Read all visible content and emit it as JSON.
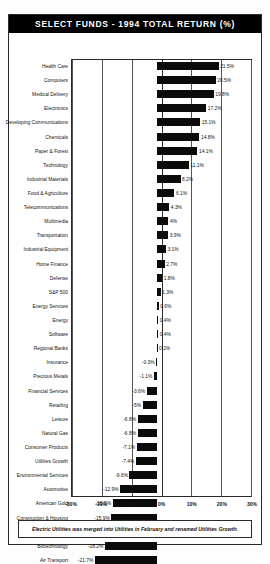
{
  "title": "SELECT FUNDS - 1994 TOTAL RETURN (%)",
  "footnote": "Electric Utilities was merged into Utilities in February and renamed Utilities Growth.",
  "chart_data": {
    "type": "bar",
    "orientation": "horizontal",
    "title": "SELECT FUNDS - 1994 TOTAL RETURN (%)",
    "xlabel": "",
    "ylabel": "",
    "xlim": [
      -30,
      30
    ],
    "grid": true,
    "legend": false,
    "ticks": [
      "-30%",
      "-20%",
      "-10%",
      "0%",
      "10%",
      "20%",
      "30%"
    ],
    "tickvalues": [
      -30,
      -20,
      -10,
      0,
      10,
      20,
      30
    ],
    "categories": [
      "Health Care",
      "Computers",
      "Medical Delivery",
      "Electronics",
      "Developing Communications",
      "Chemicals",
      "Paper & Forest",
      "Technology",
      "Industrial Materials",
      "Food & Agriculture",
      "Telecommunications",
      "Multimedia",
      "Transportation",
      "Industrial Equipment",
      "Home Finance",
      "Defense",
      "S&P 500",
      "Energy Services",
      "Energy",
      "Software",
      "Regional Banks",
      "Insurance",
      "Precious Metals",
      "Financial Services",
      "Retailing",
      "Leisure",
      "Natural Gas",
      "Consumer Products",
      "Utilities Growth",
      "Environmental Services",
      "Automotive",
      "American Gold",
      "Construction & Housing",
      "Brokerage",
      "Biotechnology",
      "Air Transport"
    ],
    "values": [
      21.5,
      20.5,
      19.8,
      17.2,
      15.1,
      14.8,
      14.1,
      11.1,
      8.2,
      6.1,
      4.3,
      4,
      3.9,
      3.1,
      2.7,
      1.8,
      1.3,
      0.6,
      0.4,
      0.4,
      0.2,
      -0.3,
      -1.1,
      -3.6,
      -5,
      -6.8,
      -6.8,
      -7.1,
      -7.4,
      -9.6,
      -12.9,
      -15.5,
      -15.9,
      -17.3,
      -18.2,
      -21.7
    ],
    "labels": [
      "21.5%",
      "20.5%",
      "19.8%",
      "17.2%",
      "15.1%",
      "14.8%",
      "14.1%",
      "11.1%",
      "8.2%",
      "6.1%",
      "4.3%",
      "4%",
      "3.9%",
      "3.1%",
      "2.7%",
      "1.8%",
      "1.3%",
      "0.6%",
      "0.4%",
      "0.4%",
      "0.2%",
      "-0.3%",
      "-1.1%",
      "-3.6%",
      "-5%",
      "-6.8%",
      "-6.8%",
      "-7.1%",
      "-7.4%",
      "-9.6%",
      "-12.9%",
      "-15.5%",
      "-15.9%",
      "-17.3%",
      "-18.2%",
      "-21.7%"
    ],
    "bar_color": "#0b0b0b"
  }
}
